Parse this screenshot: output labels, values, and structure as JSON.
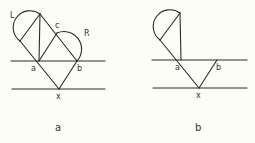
{
  "panels": [
    {
      "caption": "a",
      "labels": {
        "L": "L",
        "c": "c",
        "R": "R",
        "a": "a",
        "b": "b",
        "x": "x"
      }
    },
    {
      "caption": "b",
      "labels": {
        "a": "a",
        "b": "b",
        "x": "x"
      }
    }
  ],
  "colors": {
    "ink": "#2a2a2a",
    "background": "#fdfdf7"
  }
}
